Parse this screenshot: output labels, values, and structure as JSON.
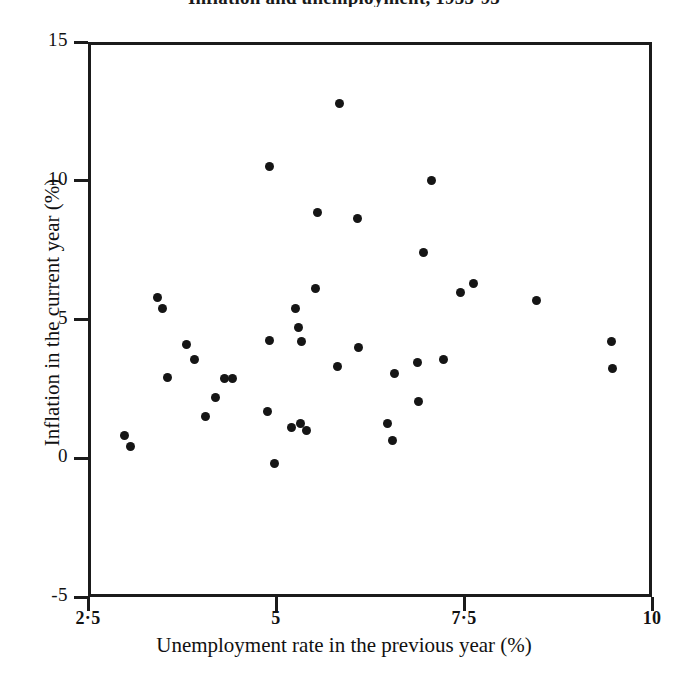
{
  "chart_data": {
    "type": "scatter",
    "title": "Inflation and unemployment, 1955-95",
    "xlabel": "Unemployment rate in the previous year (%)",
    "ylabel": "Inflation in the current year (%)",
    "xlim": [
      2.5,
      10
    ],
    "ylim": [
      -5,
      15
    ],
    "xticks": [
      2.5,
      5,
      7.5,
      10
    ],
    "xtick_labels": [
      "2·5",
      "5",
      "7·5",
      "10"
    ],
    "yticks": [
      -5,
      0,
      5,
      10,
      15
    ],
    "ytick_labels": [
      "-5",
      "0",
      "5",
      "10",
      "15"
    ],
    "grid": false,
    "legend": "none",
    "marker": "filled-circle",
    "marker_color": "#151515",
    "points": [
      {
        "x": 3.07,
        "y": 0.41
      },
      {
        "x": 2.98,
        "y": 0.82
      },
      {
        "x": 3.42,
        "y": 5.78
      },
      {
        "x": 3.49,
        "y": 5.39
      },
      {
        "x": 3.56,
        "y": 2.9
      },
      {
        "x": 3.81,
        "y": 4.1
      },
      {
        "x": 3.91,
        "y": 3.55
      },
      {
        "x": 4.06,
        "y": 1.5
      },
      {
        "x": 4.19,
        "y": 2.2
      },
      {
        "x": 4.31,
        "y": 2.89
      },
      {
        "x": 4.42,
        "y": 2.88
      },
      {
        "x": 4.92,
        "y": 10.5
      },
      {
        "x": 4.92,
        "y": 4.25
      },
      {
        "x": 4.89,
        "y": 1.7
      },
      {
        "x": 4.98,
        "y": -0.2
      },
      {
        "x": 5.26,
        "y": 5.4
      },
      {
        "x": 5.3,
        "y": 4.7
      },
      {
        "x": 5.34,
        "y": 4.2
      },
      {
        "x": 5.21,
        "y": 1.1
      },
      {
        "x": 5.32,
        "y": 1.25
      },
      {
        "x": 5.41,
        "y": 1.0
      },
      {
        "x": 5.55,
        "y": 8.85
      },
      {
        "x": 5.52,
        "y": 6.1
      },
      {
        "x": 5.85,
        "y": 12.8
      },
      {
        "x": 5.82,
        "y": 3.3
      },
      {
        "x": 6.08,
        "y": 8.65
      },
      {
        "x": 6.1,
        "y": 4.0
      },
      {
        "x": 6.48,
        "y": 1.25
      },
      {
        "x": 6.55,
        "y": 0.65
      },
      {
        "x": 6.57,
        "y": 3.05
      },
      {
        "x": 6.88,
        "y": 3.45
      },
      {
        "x": 6.9,
        "y": 2.05
      },
      {
        "x": 6.96,
        "y": 7.4
      },
      {
        "x": 7.07,
        "y": 10.0
      },
      {
        "x": 7.23,
        "y": 3.55
      },
      {
        "x": 7.45,
        "y": 5.98
      },
      {
        "x": 7.62,
        "y": 6.3
      },
      {
        "x": 8.47,
        "y": 5.7
      },
      {
        "x": 9.46,
        "y": 4.2
      },
      {
        "x": 9.47,
        "y": 3.25
      }
    ]
  },
  "axis": {
    "x_title": "Unemployment rate in the previous year (%)",
    "y_title": "Inflation in the current year (%)"
  }
}
